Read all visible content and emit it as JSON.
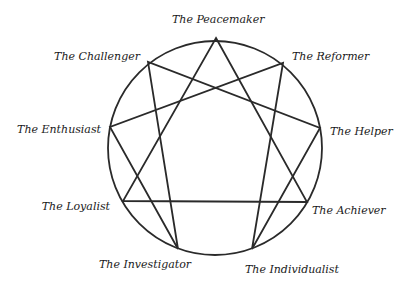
{
  "diagram": {
    "stroke_color": "#2a2a2a",
    "circle": {
      "cx": 215,
      "cy": 148,
      "r": 107
    },
    "points": [
      {
        "id": 9,
        "label": "The Peacemaker",
        "x": 216,
        "y": 38
      },
      {
        "id": 1,
        "label": "The Reformer",
        "x": 283,
        "y": 63
      },
      {
        "id": 2,
        "label": "The Helper",
        "x": 320,
        "y": 128
      },
      {
        "id": 3,
        "label": "The Achiever",
        "x": 307,
        "y": 202
      },
      {
        "id": 4,
        "label": "The Individualist",
        "x": 252,
        "y": 249
      },
      {
        "id": 5,
        "label": "The Investigator",
        "x": 178,
        "y": 249
      },
      {
        "id": 6,
        "label": "The Loyalist",
        "x": 123,
        "y": 201
      },
      {
        "id": 7,
        "label": "The Enthusiast",
        "x": 110,
        "y": 127
      },
      {
        "id": 8,
        "label": "The Challenger",
        "x": 148,
        "y": 62
      }
    ],
    "triangle": [
      9,
      3,
      6
    ],
    "hexad": [
      1,
      4,
      2,
      8,
      5,
      7
    ],
    "labels": {
      "peacemaker": "The Peacemaker",
      "reformer": "The Reformer",
      "helper": "The Helper",
      "achiever": "The Achiever",
      "individualist": "The Individualist",
      "investigator": "The Investigator",
      "loyalist": "The Loyalist",
      "enthusiast": "The Enthusiast",
      "challenger": "The Challenger"
    }
  }
}
